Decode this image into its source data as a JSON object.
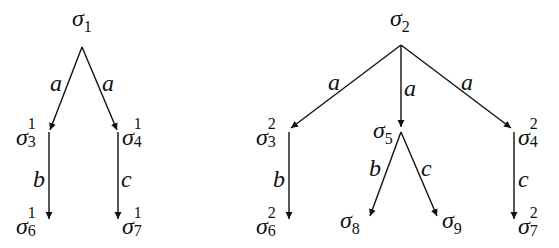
{
  "diagram": {
    "type": "transition-trees",
    "trees": [
      {
        "root": {
          "base": "σ",
          "sub": "1",
          "sup": ""
        },
        "children": [
          {
            "edge": "a",
            "node": {
              "base": "σ",
              "sub": "3",
              "sup": "1"
            },
            "children": [
              {
                "edge": "b",
                "node": {
                  "base": "σ",
                  "sub": "6",
                  "sup": "1"
                }
              }
            ]
          },
          {
            "edge": "a",
            "node": {
              "base": "σ",
              "sub": "4",
              "sup": "1"
            },
            "children": [
              {
                "edge": "c",
                "node": {
                  "base": "σ",
                  "sub": "7",
                  "sup": "1"
                }
              }
            ]
          }
        ]
      },
      {
        "root": {
          "base": "σ",
          "sub": "2",
          "sup": ""
        },
        "children": [
          {
            "edge": "a",
            "node": {
              "base": "σ",
              "sub": "3",
              "sup": "2"
            },
            "children": [
              {
                "edge": "b",
                "node": {
                  "base": "σ",
                  "sub": "6",
                  "sup": "2"
                }
              }
            ]
          },
          {
            "edge": "a",
            "node": {
              "base": "σ",
              "sub": "5",
              "sup": ""
            },
            "children": [
              {
                "edge": "b",
                "node": {
                  "base": "σ",
                  "sub": "8",
                  "sup": ""
                }
              },
              {
                "edge": "c",
                "node": {
                  "base": "σ",
                  "sub": "9",
                  "sup": ""
                }
              }
            ]
          },
          {
            "edge": "a",
            "node": {
              "base": "σ",
              "sub": "4",
              "sup": "2"
            },
            "children": [
              {
                "edge": "c",
                "node": {
                  "base": "σ",
                  "sub": "7",
                  "sup": "2"
                }
              }
            ]
          }
        ]
      }
    ]
  },
  "labels": {
    "sigma": "σ",
    "t1": {
      "root_sub": "1",
      "n3_sub": "3",
      "n3_sup": "1",
      "n4_sub": "4",
      "n4_sup": "1",
      "n6_sub": "6",
      "n6_sup": "1",
      "n7_sub": "7",
      "n7_sup": "1",
      "e_left": "a",
      "e_right": "a",
      "e_b": "b",
      "e_c": "c"
    },
    "t2": {
      "root_sub": "2",
      "n3_sub": "3",
      "n3_sup": "2",
      "n5_sub": "5",
      "n4_sub": "4",
      "n4_sup": "2",
      "n6_sub": "6",
      "n6_sup": "2",
      "n8_sub": "8",
      "n9_sub": "9",
      "n7_sub": "7",
      "n7_sup": "2",
      "e_left": "a",
      "e_mid": "a",
      "e_right": "a",
      "e_b_left": "b",
      "e_b_mid": "b",
      "e_c_mid": "c",
      "e_c_right": "c"
    }
  }
}
